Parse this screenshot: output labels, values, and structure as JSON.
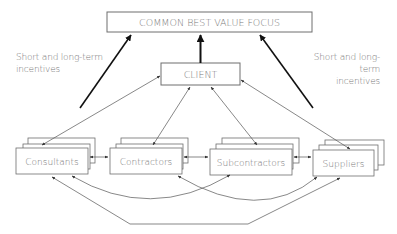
{
  "diagram": {
    "title_box": "COMMON BEST VALUE FOCUS",
    "client_box": "CLIENT",
    "nodes": [
      {
        "label": "Consultants"
      },
      {
        "label": "Contractors"
      },
      {
        "label": "Subcontractors"
      },
      {
        "label": "Suppliers"
      }
    ],
    "side_labels": {
      "left": {
        "line1": "Short and long-term",
        "line2": "incentives"
      },
      "right": {
        "line1": "Short and long-term",
        "line2": "incentives"
      }
    },
    "colors": {
      "box_border": "#6e6e6e",
      "text": "#7a7a7a",
      "thick_arrow": "#222222",
      "thin_arrow": "#555555",
      "background": "#ffffff"
    }
  }
}
